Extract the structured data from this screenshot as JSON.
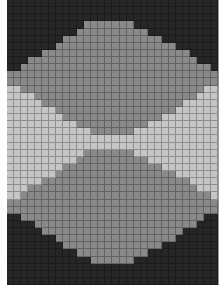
{
  "grid": {
    "columns": 30,
    "rows": 40,
    "colors": {
      "D": "#262626",
      "G": "#8a8a8a",
      "L": "#c6c6c6"
    },
    "pattern": [
      "DDDDDDDDDDDDDDDDDDDDDDDDDDDDDD",
      "DDDDDDDDDDDDDDDDDDDDDDDDDDDDDD",
      "DDDDDDDDDDDDDDDDDDDDDDDDDDDDDD",
      "DDDDDDDDDDDGGGGGGGDDDDDDDDDDDD",
      "DDDDDDDDDDGGGGGGGGGGDDDDDDDDDD",
      "DDDDDDDDGGGGGGGGGGGGGGDDDDDDDD",
      "DDDDDDDGGGGGGGGGGGGGGGGGDDDDDD",
      "DDDDDGGGGGGGGGGGGGGGGGGGGGDDDD",
      "DDDGGGGGGGGGGGGGGGGGGGGGGGGDDD",
      "DDGGGGGGGGGGGGGGGGGGGGGGGGGGGD",
      "GGGGGGGGGGGGGGGGGGGGGGGGGGGGGG",
      "GGGGGGGGGGGGGGGGGGGGGGGGGGGGGG",
      "LLGGGGGGGGGGGGGGGGGGGGGGGGGGLL",
      "LLLLGGGGGGGGGGGGGGGGGGGGGGGLLL",
      "LLLLLGGGGGGGGGGGGGGGGGGGGLLLLL",
      "LLLLLLLGGGGGGGGGGGGGGGGGLLLLLL",
      "LLLLLLLLGGGGGGGGGGGGGGLLLLLLLL",
      "LLLLLLLLLLGGGGGGGGGGLLLLLLLLLL",
      "LLLLLLLLLLLLGGGGGGLLLLLLLLLLLL",
      "LLLLLLLLLLLLLLLLLLLLLLLLLLLLLL",
      "LLLLLLLLLLLLLLLLLLLLLLLLLLLLLL",
      "LLLLLLLLLLLGGGGGGGLLLLLLLLLLLL",
      "LLLLLLLLLLGGGGGGGGGGLLLLLLLLLL",
      "LLLLLLLLGGGGGGGGGGGGGGLLLLLLLL",
      "LLLLLLLGGGGGGGGGGGGGGGGGLLLLLL",
      "LLLLLGGGGGGGGGGGGGGGGGGGGGLLLL",
      "LLLGGGGGGGGGGGGGGGGGGGGGGGGLLL",
      "LLGGGGGGGGGGGGGGGGGGGGGGGGGGGL",
      "GGGGGGGGGGGGGGGGGGGGGGGGGGGGGG",
      "GGGGGGGGGGGGGGGGGGGGGGGGGGGGGG",
      "DDGGGGGGGGGGGGGGGGGGGGGGGGGGDD",
      "DDDDGGGGGGGGGGGGGGGGGGGGGGGDDD",
      "DDDDDGGGGGGGGGGGGGGGGGGGGDDDDD",
      "DDDDDDDGGGGGGGGGGGGGGGGGDDDDDD",
      "DDDDDDDDGGGGGGGGGGGGGGDDDDDDDD",
      "DDDDDDDDDDGGGGGGGGGGDDDDDDDDDD",
      "DDDDDDDDDDDDGGGGGGDDDDDDDDDDDD",
      "DDDDDDDDDDDDDDDDDDDDDDDDDDDDDD",
      "DDDDDDDDDDDDDDDDDDDDDDDDDDDDDD",
      "DDDDDDDDDDDDDDDDDDDDDDDDDDDDDD"
    ]
  }
}
